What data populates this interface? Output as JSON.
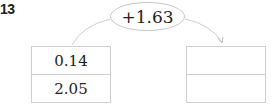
{
  "problem_number": "13",
  "operation": "+1.63",
  "left_box": {
    "top": "0.14",
    "bottom": "2.05"
  },
  "right_box": {
    "top": "",
    "bottom": ""
  },
  "colors": {
    "line": "#c8c8c8",
    "text": "#222222"
  }
}
